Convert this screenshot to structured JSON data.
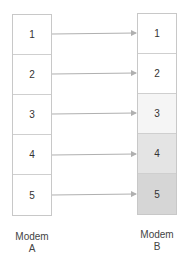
{
  "modem_a": {
    "label_line1": "Modem",
    "label_line2": "A",
    "cells": [
      "1",
      "2",
      "3",
      "4",
      "5"
    ]
  },
  "modem_b": {
    "label_line1": "Modem",
    "label_line2": "B",
    "cells": [
      "1",
      "2",
      "3",
      "4",
      "5"
    ],
    "cell_colors": [
      "#ffffff",
      "#ffffff",
      "#f5f5f5",
      "#e4e4e4",
      "#d6d6d6"
    ]
  },
  "arrow_color": "#b0b0b0"
}
